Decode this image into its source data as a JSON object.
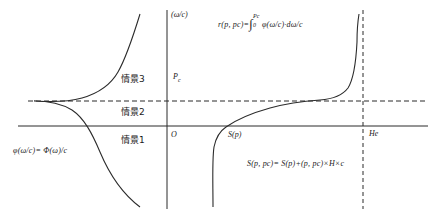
{
  "figure": {
    "type": "diagram",
    "background": "#ffffff",
    "stroke_color": "#2b2b2b",
    "width": 432,
    "height": 218
  },
  "axes": {
    "vertical_axis_label": "(ω/c)",
    "origin_label": "O",
    "threshold_label": "Pc",
    "threshold_label_base": "P",
    "threshold_label_sub": "c",
    "right_boundary_label": "He",
    "sigmoid_axis_label": "S(p)"
  },
  "regions": [
    {
      "name": "scenario-3",
      "label": "情景3"
    },
    {
      "name": "scenario-2",
      "label": "情景2"
    },
    {
      "name": "scenario-1",
      "label": "情景1"
    }
  ],
  "formulas": {
    "left": {
      "name": "density-formula",
      "parts": {
        "lhs": "φ(ω/c)=",
        "rhs": "Φ(ω)/c"
      },
      "full": "φ(ω/c)= Φ(ω)/c"
    },
    "top_right": {
      "name": "integral-formula",
      "parts": {
        "lhs": "r(p, pc)=",
        "int_upper": "Pc",
        "int_lower": "0",
        "integrand": "φ(ω/c)",
        "measure": "·dω/c"
      },
      "full": "r(p, pc)=∫₀^Pc φ(ω/c)·dω/c"
    },
    "bottom_right": {
      "name": "supply-formula",
      "parts": {
        "lhs": "S(p, pc)=",
        "rhs": "S(p)+(p, pc)×H×c"
      },
      "full": "S(p, pc)= S(p)+(p, pc)×H×c"
    }
  }
}
